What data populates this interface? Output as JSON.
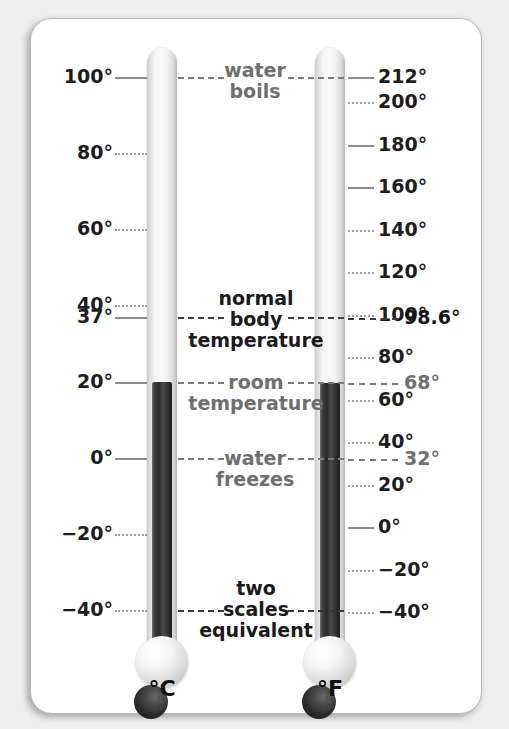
{
  "figure": {
    "card_background": "#ffffff",
    "page_background": "#eeeeee"
  },
  "chart_data": {
    "type": "line",
    "xlabel": "",
    "ylabel": "Temperature",
    "grid": false,
    "legend": "none",
    "series": [
      {
        "name": "Celsius",
        "unit": "°C",
        "axis_label": "°C",
        "ylim": [
          -50,
          110
        ],
        "reading": 20,
        "ticks": [
          {
            "value": 100,
            "label": "100°",
            "emphasis": "solid"
          },
          {
            "value": 80,
            "label": "80°",
            "emphasis": "dotted"
          },
          {
            "value": 60,
            "label": "60°",
            "emphasis": "dotted"
          },
          {
            "value": 40,
            "label": "40°",
            "emphasis": "dotted"
          },
          {
            "value": 37,
            "label": "37°",
            "emphasis": "solid"
          },
          {
            "value": 20,
            "label": "20°",
            "emphasis": "solid"
          },
          {
            "value": 0,
            "label": "0°",
            "emphasis": "solid"
          },
          {
            "value": -20,
            "label": "−20°",
            "emphasis": "dotted"
          },
          {
            "value": -40,
            "label": "−40°",
            "emphasis": "dotted"
          }
        ]
      },
      {
        "name": "Fahrenheit",
        "unit": "°F",
        "axis_label": "°F",
        "ylim": [
          -58,
          230
        ],
        "reading": 68,
        "ticks": [
          {
            "value": 212,
            "label": "212°",
            "emphasis": "solid"
          },
          {
            "value": 200,
            "label": "200°",
            "emphasis": "dotted"
          },
          {
            "value": 180,
            "label": "180°",
            "emphasis": "solid"
          },
          {
            "value": 160,
            "label": "160°",
            "emphasis": "solid"
          },
          {
            "value": 140,
            "label": "140°",
            "emphasis": "dotted"
          },
          {
            "value": 120,
            "label": "120°",
            "emphasis": "dotted"
          },
          {
            "value": 100,
            "label": "100°",
            "emphasis": "dotted"
          },
          {
            "value": 80,
            "label": "80°",
            "emphasis": "dotted"
          },
          {
            "value": 60,
            "label": "60°",
            "emphasis": "dotted"
          },
          {
            "value": 40,
            "label": "40°",
            "emphasis": "dotted"
          },
          {
            "value": 20,
            "label": "20°",
            "emphasis": "dotted"
          },
          {
            "value": 0,
            "label": "0°",
            "emphasis": "solid"
          },
          {
            "value": -20,
            "label": "−20°",
            "emphasis": "dotted"
          },
          {
            "value": -40,
            "label": "−40°",
            "emphasis": "dotted"
          }
        ]
      }
    ],
    "reference_lines": [
      {
        "id": "water-boils",
        "annotation": "water\nboils",
        "celsius": 100,
        "fahrenheit": 212,
        "celsius_label": "100°",
        "fahrenheit_label": "212°",
        "callout": "",
        "emphasis": "normal"
      },
      {
        "id": "normal-body-temperature",
        "annotation": "normal\nbody\ntemperature",
        "celsius": 37,
        "fahrenheit": 98.6,
        "celsius_label": "37°",
        "fahrenheit_label": "98.6°",
        "callout": "98.6°",
        "emphasis": "strong"
      },
      {
        "id": "room-temperature",
        "annotation": "room\ntemperature",
        "celsius": 20,
        "fahrenheit": 68,
        "celsius_label": "20°",
        "fahrenheit_label": "68°",
        "callout": "68°",
        "emphasis": "normal"
      },
      {
        "id": "water-freezes",
        "annotation": "water\nfreezes",
        "celsius": 0,
        "fahrenheit": 32,
        "celsius_label": "0°",
        "fahrenheit_label": "32°",
        "callout": "32°",
        "emphasis": "normal"
      },
      {
        "id": "two-scales-equivalent",
        "annotation": "two\nscales\nequivalent",
        "celsius": -40,
        "fahrenheit": -40,
        "celsius_label": "−40°",
        "fahrenheit_label": "−40°",
        "callout": "",
        "emphasis": "strong"
      }
    ]
  },
  "celsius_scale": {
    "caption": "°C",
    "labels": [
      "100°",
      "80°",
      "60°",
      "40°",
      "37°",
      "20°",
      "0°",
      "−20°",
      "−40°"
    ]
  },
  "fahrenheit_scale": {
    "caption": "°F",
    "labels": [
      "212°",
      "200°",
      "180°",
      "160°",
      "140°",
      "120°",
      "100°",
      "80°",
      "60°",
      "40°",
      "20°",
      "0°",
      "−20°",
      "−40°"
    ]
  },
  "annotations": {
    "water_boils": "water\nboils",
    "normal_body_temperature": "normal\nbody\ntemperature",
    "room_temperature": "room\ntemperature",
    "water_freezes": "water\nfreezes",
    "two_scales_equivalent": "two\nscales\nequivalent"
  },
  "callouts": {
    "body_temp_f": "98.6°",
    "room_temp_f": "68°",
    "freezing_f": "32°"
  },
  "colors": {
    "ink_dark": "#1a1a1a",
    "ink_gray": "#6f6f6f",
    "tick_gray": "#8b8b8b",
    "mercury": "#2c2c2c",
    "glass": "#f4f4f4"
  }
}
